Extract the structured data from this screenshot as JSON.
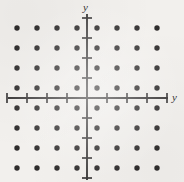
{
  "figure": {
    "kind": "coordinate-lattice-plot",
    "background_color": "#f2f0ed",
    "ink_color": "#2f2d2d",
    "width": 184,
    "height": 182,
    "labels": {
      "vertical_axis_label": "y",
      "horizontal_axis_label": "y"
    }
  },
  "chart_data": {
    "type": "scatter",
    "title": "",
    "subtitle": "",
    "xlabel": "y",
    "ylabel": "y",
    "xlim": [
      -4.5,
      4.5
    ],
    "ylim": [
      -4.5,
      4.5
    ],
    "grid": false,
    "legend": null,
    "annotations": [],
    "axes": {
      "origin_px": [
        87,
        98
      ],
      "x_axis_span_px": [
        8,
        168
      ],
      "y_axis_span_px": [
        14,
        180
      ],
      "tick_spacing_px": 20,
      "x_tick_values": [
        -4,
        -3,
        -2,
        -1,
        1,
        2,
        3,
        4
      ],
      "y_tick_values": [
        -4,
        -3,
        -2,
        -1,
        1,
        2,
        3,
        4
      ],
      "x_tick_labels": [
        "",
        "",
        "",
        "",
        "",
        "",
        "",
        ""
      ],
      "y_tick_labels": [
        "",
        "",
        "",
        "",
        "",
        "",
        "",
        ""
      ],
      "tick_half_length_px": 5
    },
    "marker": {
      "shape": "circle",
      "filled": true,
      "radius_px": 2.7,
      "color": "#2f2d2d"
    },
    "point_count": 64,
    "x": [
      -3.5,
      -2.5,
      -1.5,
      -0.5,
      0.5,
      1.5,
      2.5,
      3.5
    ],
    "y": [
      3.5,
      2.5,
      1.5,
      0.5,
      -0.5,
      -1.5,
      -2.5,
      -3.5
    ],
    "points": [
      [
        -3.5,
        3.5
      ],
      [
        -2.5,
        3.5
      ],
      [
        -1.5,
        3.5
      ],
      [
        -0.5,
        3.5
      ],
      [
        0.5,
        3.5
      ],
      [
        1.5,
        3.5
      ],
      [
        2.5,
        3.5
      ],
      [
        3.5,
        3.5
      ],
      [
        -3.5,
        2.5
      ],
      [
        -2.5,
        2.5
      ],
      [
        -1.5,
        2.5
      ],
      [
        -0.5,
        2.5
      ],
      [
        0.5,
        2.5
      ],
      [
        1.5,
        2.5
      ],
      [
        2.5,
        2.5
      ],
      [
        3.5,
        2.5
      ],
      [
        -3.5,
        1.5
      ],
      [
        -2.5,
        1.5
      ],
      [
        -1.5,
        1.5
      ],
      [
        -0.5,
        1.5
      ],
      [
        0.5,
        1.5
      ],
      [
        1.5,
        1.5
      ],
      [
        2.5,
        1.5
      ],
      [
        3.5,
        1.5
      ],
      [
        -3.5,
        0.5
      ],
      [
        -2.5,
        0.5
      ],
      [
        -1.5,
        0.5
      ],
      [
        -0.5,
        0.5
      ],
      [
        0.5,
        0.5
      ],
      [
        1.5,
        0.5
      ],
      [
        2.5,
        0.5
      ],
      [
        3.5,
        0.5
      ],
      [
        -3.5,
        -0.5
      ],
      [
        -2.5,
        -0.5
      ],
      [
        -1.5,
        -0.5
      ],
      [
        -0.5,
        -0.5
      ],
      [
        0.5,
        -0.5
      ],
      [
        1.5,
        -0.5
      ],
      [
        2.5,
        -0.5
      ],
      [
        3.5,
        -0.5
      ],
      [
        -3.5,
        -1.5
      ],
      [
        -2.5,
        -1.5
      ],
      [
        -1.5,
        -1.5
      ],
      [
        -0.5,
        -1.5
      ],
      [
        0.5,
        -1.5
      ],
      [
        1.5,
        -1.5
      ],
      [
        2.5,
        -1.5
      ],
      [
        3.5,
        -1.5
      ],
      [
        -3.5,
        -2.5
      ],
      [
        -2.5,
        -2.5
      ],
      [
        -1.5,
        -2.5
      ],
      [
        -0.5,
        -2.5
      ],
      [
        0.5,
        -2.5
      ],
      [
        1.5,
        -2.5
      ],
      [
        2.5,
        -2.5
      ],
      [
        3.5,
        -2.5
      ],
      [
        -3.5,
        -3.5
      ],
      [
        -2.5,
        -3.5
      ],
      [
        -1.5,
        -3.5
      ],
      [
        -0.5,
        -3.5
      ],
      [
        0.5,
        -3.5
      ],
      [
        1.5,
        -3.5
      ],
      [
        2.5,
        -3.5
      ],
      [
        3.5,
        -3.5
      ]
    ]
  }
}
